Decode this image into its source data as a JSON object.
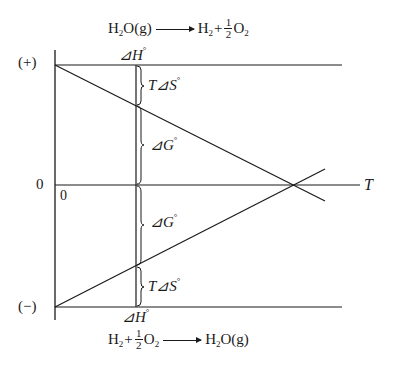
{
  "top_reaction": {
    "reactant": "H",
    "reactant_sub": "2",
    "reactant_rest": "O(g)",
    "product1": "H",
    "product1_sub": "2",
    "plus": "+",
    "frac_num": "1",
    "frac_den": "2",
    "product2": "O",
    "product2_sub": "2"
  },
  "bottom_reaction": {
    "reactant1": "H",
    "reactant1_sub": "2",
    "plus": "+",
    "frac_num": "1",
    "frac_den": "2",
    "reactant2": "O",
    "reactant2_sub": "2",
    "product": "H",
    "product_sub": "2",
    "product_rest": "O(g)"
  },
  "axis": {
    "positive_label": "(+)",
    "negative_label": "(−)",
    "zero_y_label": "0",
    "zero_x_label": "0",
    "x_label": "T"
  },
  "annotations": {
    "delta_h_top": "⊿H",
    "delta_h_bottom": "⊿H",
    "t_delta_s_top": "T⊿S",
    "t_delta_s_bottom": "T⊿S",
    "delta_g_top": "⊿G",
    "delta_g_bottom": "⊿G",
    "degree": "°"
  },
  "colors": {
    "ink": "#1a1a1a",
    "background": "#ffffff"
  }
}
